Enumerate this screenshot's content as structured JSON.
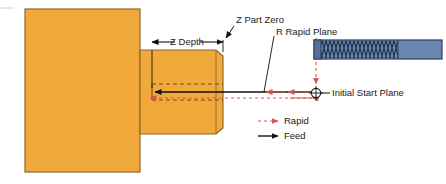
{
  "diagram": {
    "labels": {
      "z_part_zero": "Z Part Zero",
      "r_rapid_plane": "R Rapid Plane",
      "z_depth": "Z Depth",
      "initial_start_plane": "Initial Start Plane"
    },
    "legend": [
      {
        "label": "Rapid",
        "style": "dashed",
        "color": "#D9534F"
      },
      {
        "label": "Feed",
        "style": "solid",
        "color": "#111111"
      }
    ],
    "colors": {
      "workpiece_fill": "#F2A93B",
      "workpiece_edge": "#8A6A2A",
      "tool_fill": "#6A87B0",
      "tool_edge": "#2E3F5C",
      "rapid": "#D9534F",
      "feed": "#111111",
      "background": "#FFFFFF"
    },
    "parts": {
      "workpiece_name": "workpiece-block",
      "boss_name": "workpiece-boss",
      "hole_name": "tapped-hole",
      "tool_name": "tap-tool"
    }
  }
}
